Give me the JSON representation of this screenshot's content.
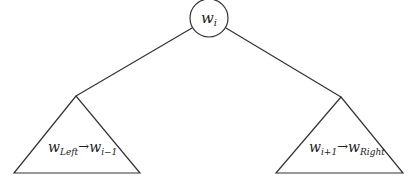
{
  "diagram": {
    "type": "tree",
    "root": {
      "label_base": "w",
      "label_sub": "i"
    },
    "left_subtree": {
      "from_base": "w",
      "from_sub": "Left",
      "arrow": "→",
      "to_base": "w",
      "to_sub": "i−1"
    },
    "right_subtree": {
      "from_base": "w",
      "from_sub": "i+1",
      "arrow": "→",
      "to_base": "w",
      "to_sub": "Right"
    },
    "colors": {
      "stroke": "#333333",
      "background": "#ffffff",
      "text": "#222222"
    }
  }
}
